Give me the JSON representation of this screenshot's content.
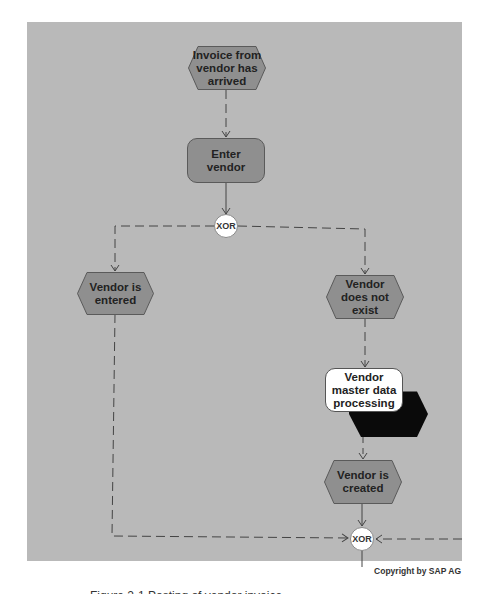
{
  "diagram": {
    "type": "event-driven process chain",
    "nodes": [
      {
        "id": "e1",
        "kind": "event",
        "label": "Invoice from vendor has arrived"
      },
      {
        "id": "f1",
        "kind": "function",
        "label": "Enter vendor"
      },
      {
        "id": "x1",
        "kind": "connector",
        "label": "XOR"
      },
      {
        "id": "e2",
        "kind": "event",
        "label": "Vendor is entered"
      },
      {
        "id": "e3",
        "kind": "event",
        "label": "Vendor does not exist"
      },
      {
        "id": "s1",
        "kind": "subprocess",
        "label": "Vendor master data processing"
      },
      {
        "id": "e4",
        "kind": "event",
        "label": "Vendor is created"
      },
      {
        "id": "x2",
        "kind": "connector",
        "label": "XOR"
      }
    ],
    "edges": [
      {
        "from": "e1",
        "to": "f1",
        "style": "dashed"
      },
      {
        "from": "f1",
        "to": "x1",
        "style": "solid"
      },
      {
        "from": "x1",
        "to": "e2",
        "style": "dashed"
      },
      {
        "from": "x1",
        "to": "e3",
        "style": "dashed"
      },
      {
        "from": "e3",
        "to": "s1",
        "style": "dashed"
      },
      {
        "from": "s1",
        "to": "e4",
        "style": "dashed"
      },
      {
        "from": "e4",
        "to": "x2",
        "style": "solid"
      },
      {
        "from": "e2",
        "to": "x2",
        "style": "dashed"
      },
      {
        "from": "offpage-right",
        "to": "x2",
        "style": "dashed"
      }
    ]
  },
  "labels": {
    "e1": "Invoice from vendor has arrived",
    "f1": "Enter vendor",
    "x1": "XOR",
    "e2": "Vendor is entered",
    "e3": "Vendor does not exist",
    "s1": "Vendor master data processing",
    "e4": "Vendor is created",
    "x2": "XOR"
  },
  "footer": {
    "copyright": "Copyright by SAP AG",
    "caption": "Figure 2-1   Posting of vendor invoice"
  },
  "colors": {
    "panel": "#b9b9b9",
    "event_fill": "#8f8f8f",
    "function_fill": "#8f8f8f",
    "subprocess_fill": "#ffffff",
    "subprocess_shadow": "#000000",
    "connector_fill": "#ffffff"
  }
}
